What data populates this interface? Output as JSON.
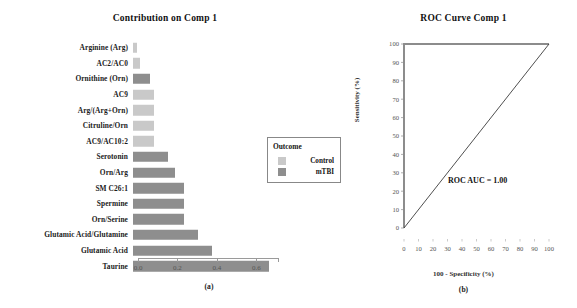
{
  "figure": {
    "panel_a_caption": "(a)",
    "panel_b_caption": "(b)"
  },
  "legend": {
    "title": "Outcome",
    "items": [
      {
        "label": "Control",
        "color": "#c9c9c9"
      },
      {
        "label": "mTBI",
        "color": "#8e8e8e"
      }
    ]
  },
  "chart_data": [
    {
      "type": "bar",
      "orientation": "horizontal",
      "title": "Contribution on Comp 1",
      "xlabel": "",
      "ylabel": "",
      "xlim": [
        0.0,
        0.71
      ],
      "xticks": [
        "0.0",
        "0.2",
        "0.4",
        "0.6"
      ],
      "xtick_values": [
        0.0,
        0.2,
        0.4,
        0.6
      ],
      "grid": false,
      "categories": [
        "Arginine (Arg)",
        "AC2/AC0",
        "Ornithine (Orn)",
        "AC9",
        "Arg/(Arg+Orn)",
        "Citruline/Orn",
        "AC9/AC10:2",
        "Serotonin",
        "Orn/Arg",
        "SM C26:1",
        "Spermine",
        "Orn/Serine",
        "Glutamic Acid/Glutamine",
        "Glutamic Acid",
        "Taurine"
      ],
      "values": [
        0.02,
        0.035,
        0.085,
        0.105,
        0.105,
        0.105,
        0.105,
        0.175,
        0.215,
        0.26,
        0.26,
        0.26,
        0.33,
        0.4,
        0.69
      ],
      "group": [
        "Control",
        "Control",
        "mTBI",
        "Control",
        "Control",
        "Control",
        "Control",
        "mTBI",
        "mTBI",
        "mTBI",
        "mTBI",
        "mTBI",
        "mTBI",
        "mTBI",
        "mTBI"
      ],
      "colors": {
        "Control": "#c9c9c9",
        "mTBI": "#8e8e8e"
      }
    },
    {
      "type": "line",
      "title": "ROC Curve Comp 1",
      "xlabel": "100 - Specificity (%)",
      "ylabel": "Sensitivity (%)",
      "xlim": [
        0,
        100
      ],
      "ylim": [
        0,
        100
      ],
      "xticks": [
        "0",
        "10",
        "20",
        "30",
        "40",
        "50",
        "60",
        "70",
        "80",
        "90",
        "100"
      ],
      "yticks": [
        "0",
        "10",
        "20",
        "30",
        "40",
        "50",
        "60",
        "70",
        "80",
        "90",
        "100"
      ],
      "grid": false,
      "annotation": "ROC AUC = 1.00",
      "auc": "1.00",
      "series": [
        {
          "name": "ROC curve",
          "x": [
            0,
            0,
            100
          ],
          "y": [
            0,
            100,
            100
          ]
        },
        {
          "name": "Reference diagonal",
          "x": [
            0,
            100
          ],
          "y": [
            0,
            100
          ]
        }
      ]
    }
  ]
}
